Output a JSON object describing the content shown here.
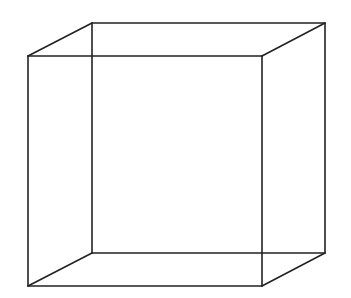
{
  "diagram": {
    "type": "wireframe-cube",
    "stroke_color": "#222222",
    "background": "#ffffff",
    "stroke_width": 1.6,
    "vertices": {
      "front_top_left": [
        28,
        56
      ],
      "front_top_right": [
        262,
        56
      ],
      "front_bottom_left": [
        28,
        286
      ],
      "front_bottom_right": [
        262,
        286
      ],
      "back_top_left": [
        92,
        23
      ],
      "back_top_right": [
        325,
        23
      ],
      "back_bottom_left": [
        92,
        253
      ],
      "back_bottom_right": [
        325,
        253
      ]
    },
    "edges": [
      [
        "front_top_left",
        "front_top_right"
      ],
      [
        "front_top_right",
        "front_bottom_right"
      ],
      [
        "front_bottom_right",
        "front_bottom_left"
      ],
      [
        "front_bottom_left",
        "front_top_left"
      ],
      [
        "back_top_left",
        "back_top_right"
      ],
      [
        "back_top_right",
        "back_bottom_right"
      ],
      [
        "back_bottom_right",
        "back_bottom_left"
      ],
      [
        "back_bottom_left",
        "back_top_left"
      ],
      [
        "front_top_left",
        "back_top_left"
      ],
      [
        "front_top_right",
        "back_top_right"
      ],
      [
        "front_bottom_left",
        "back_bottom_left"
      ],
      [
        "front_bottom_right",
        "back_bottom_right"
      ]
    ]
  }
}
